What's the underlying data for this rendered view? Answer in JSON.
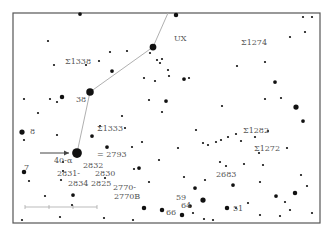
{
  "chart": {
    "colors": {
      "frame": "#555555",
      "star": "#111111",
      "line": "#b0b0b0",
      "label": "#555555",
      "arrow": "#444444"
    },
    "constellation_line": [
      [
        168,
        13
      ],
      [
        153,
        47
      ],
      [
        90,
        92
      ],
      [
        77,
        153
      ]
    ],
    "stars": [
      [
        77,
        153,
        6.5
      ],
      [
        90,
        92,
        5
      ],
      [
        153,
        47,
        4.5
      ],
      [
        22,
        132,
        3.5
      ],
      [
        24,
        172,
        3
      ],
      [
        62,
        97,
        3
      ],
      [
        80,
        14,
        2.5
      ],
      [
        112,
        71,
        2.5
      ],
      [
        92,
        136,
        2.5
      ],
      [
        107,
        147,
        2.5
      ],
      [
        139,
        168,
        2.5
      ],
      [
        73,
        195,
        2.5
      ],
      [
        144,
        208,
        3
      ],
      [
        162,
        210,
        3
      ],
      [
        176,
        15,
        3
      ],
      [
        184,
        79,
        2.5
      ],
      [
        237,
        66,
        2
      ],
      [
        265,
        62,
        2
      ],
      [
        275,
        82,
        2.5
      ],
      [
        281,
        98,
        2
      ],
      [
        265,
        99,
        2
      ],
      [
        312,
        17,
        2
      ],
      [
        303,
        17,
        2
      ],
      [
        305,
        32,
        2
      ],
      [
        290,
        37,
        2
      ],
      [
        296,
        107,
        3.5
      ],
      [
        303,
        121,
        2.5
      ],
      [
        268,
        131,
        2
      ],
      [
        287,
        148,
        2
      ],
      [
        255,
        137,
        2
      ],
      [
        205,
        180,
        2
      ],
      [
        195,
        188,
        2.5
      ],
      [
        203,
        200,
        3.5
      ],
      [
        233,
        185,
        2.5
      ],
      [
        227,
        208,
        3
      ],
      [
        204,
        219,
        2
      ],
      [
        193,
        213,
        2
      ],
      [
        182,
        215,
        3
      ],
      [
        190,
        206,
        2.5
      ],
      [
        248,
        203,
        2
      ],
      [
        276,
        196,
        2.5
      ],
      [
        285,
        202,
        2
      ],
      [
        295,
        193,
        3
      ],
      [
        290,
        210,
        2
      ],
      [
        280,
        216,
        2
      ],
      [
        260,
        215,
        2
      ],
      [
        24,
        99,
        2
      ],
      [
        38,
        113,
        2
      ],
      [
        50,
        99,
        2
      ],
      [
        57,
        102,
        2
      ],
      [
        48,
        41,
        2
      ],
      [
        54,
        65,
        2
      ],
      [
        86,
        65,
        2
      ],
      [
        99,
        61,
        2
      ],
      [
        110,
        52,
        2
      ],
      [
        127,
        51,
        2
      ],
      [
        150,
        53,
        2
      ],
      [
        157,
        60,
        2
      ],
      [
        162,
        59,
        2
      ],
      [
        168,
        70,
        2
      ],
      [
        169,
        76,
        2
      ],
      [
        166,
        101,
        2.5
      ],
      [
        149,
        100,
        2
      ],
      [
        155,
        81,
        2
      ],
      [
        144,
        78,
        2
      ],
      [
        160,
        63,
        2
      ],
      [
        189,
        78,
        2
      ],
      [
        222,
        106,
        2
      ],
      [
        196,
        130,
        2
      ],
      [
        203,
        143,
        2
      ],
      [
        236,
        134,
        2
      ],
      [
        221,
        140,
        2
      ],
      [
        226,
        166,
        2
      ],
      [
        236,
        208,
        2
      ],
      [
        178,
        148,
        2
      ],
      [
        184,
        177,
        2
      ],
      [
        162,
        112,
        2
      ],
      [
        45,
        196,
        2
      ],
      [
        72,
        205,
        2
      ],
      [
        60,
        217,
        2
      ],
      [
        22,
        220,
        2
      ],
      [
        104,
        218,
        2
      ],
      [
        133,
        220,
        2
      ],
      [
        63,
        162,
        2
      ],
      [
        63,
        171,
        2
      ],
      [
        61,
        180,
        2
      ],
      [
        29,
        181,
        2
      ],
      [
        24,
        140,
        2
      ],
      [
        57,
        135,
        2
      ],
      [
        122,
        116,
        2
      ],
      [
        125,
        128,
        2
      ],
      [
        100,
        126,
        2
      ],
      [
        149,
        182,
        2
      ],
      [
        134,
        169,
        2
      ],
      [
        105,
        178,
        2
      ],
      [
        259,
        153,
        2
      ],
      [
        263,
        165,
        2
      ],
      [
        260,
        182,
        2
      ],
      [
        307,
        186,
        2
      ],
      [
        312,
        213,
        2
      ],
      [
        213,
        220,
        2
      ],
      [
        142,
        142,
        2
      ],
      [
        132,
        147,
        2
      ],
      [
        159,
        160,
        2
      ],
      [
        228,
        137,
        2
      ],
      [
        241,
        141,
        2
      ],
      [
        244,
        164,
        2
      ],
      [
        220,
        162,
        2
      ],
      [
        216,
        142,
        2
      ],
      [
        208,
        145,
        2
      ],
      [
        301,
        175,
        2
      ]
    ],
    "labels": [
      {
        "x": 65,
        "y": 64,
        "text": "Σ1338"
      },
      {
        "x": 174,
        "y": 41,
        "text": "UX"
      },
      {
        "x": 241,
        "y": 45,
        "text": "Σ1274"
      },
      {
        "x": 76,
        "y": 102,
        "text": "38"
      },
      {
        "x": 30,
        "y": 134,
        "text": "8"
      },
      {
        "x": 97,
        "y": 131,
        "text": "Σ1333"
      },
      {
        "x": 97,
        "y": 157,
        "text": "= 2793"
      },
      {
        "x": 54,
        "y": 163,
        "text": "40-α"
      },
      {
        "x": 24,
        "y": 170,
        "text": "7"
      },
      {
        "x": 83,
        "y": 168,
        "text": "2832"
      },
      {
        "x": 57,
        "y": 176,
        "text": "2831-"
      },
      {
        "x": 95,
        "y": 176,
        "text": "2830"
      },
      {
        "x": 68,
        "y": 186,
        "text": "2834"
      },
      {
        "x": 91,
        "y": 186,
        "text": "2825"
      },
      {
        "x": 113,
        "y": 190,
        "text": "2770-"
      },
      {
        "x": 114,
        "y": 199,
        "text": "2770B"
      },
      {
        "x": 243,
        "y": 133,
        "text": "Σ1282"
      },
      {
        "x": 254,
        "y": 151,
        "text": "Σ1272"
      },
      {
        "x": 216,
        "y": 177,
        "text": "2683"
      },
      {
        "x": 176,
        "y": 200,
        "text": "59"
      },
      {
        "x": 181,
        "y": 208,
        "text": "64"
      },
      {
        "x": 166,
        "y": 215,
        "text": "66"
      },
      {
        "x": 233,
        "y": 211,
        "text": "51"
      }
    ],
    "arrow": {
      "from": [
        40,
        153
      ],
      "to": [
        69,
        153
      ]
    },
    "scale_bar": {
      "from": [
        25,
        207
      ],
      "to": [
        97,
        207
      ],
      "ticks": [
        25,
        49,
        73,
        97
      ]
    }
  }
}
